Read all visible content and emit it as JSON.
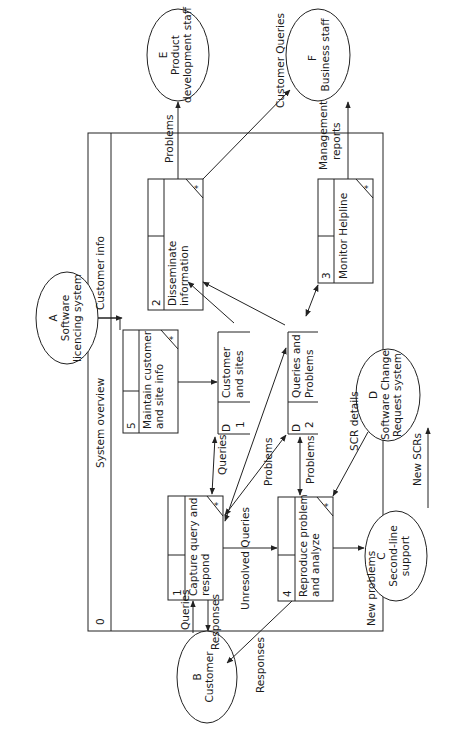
{
  "diagram": {
    "type": "data-flow-diagram",
    "orientation": "rotated-90-ccw",
    "system_boundary": {
      "id": "0",
      "title": "System overview"
    },
    "external_entities": [
      {
        "id": "A",
        "name": "Software licencing system",
        "line1": "Software",
        "line2": "licencing system"
      },
      {
        "id": "B",
        "name": "Customer",
        "line1": "Customer",
        "line2": ""
      },
      {
        "id": "C",
        "name": "Second-line support",
        "line1": "Second-line",
        "line2": "support"
      },
      {
        "id": "D",
        "name": "Software Change Request system",
        "line1": "Software Change",
        "line2": "Request system"
      },
      {
        "id": "E",
        "name": "Product development staff",
        "line1": "Product",
        "line2": "development staff"
      },
      {
        "id": "F",
        "name": "Business staff",
        "line1": "Business staff",
        "line2": ""
      }
    ],
    "processes": [
      {
        "id": "1",
        "line1": "Capture query and",
        "line2": "respond",
        "marker": "*"
      },
      {
        "id": "2",
        "line1": "Disseminate",
        "line2": "information",
        "marker": "*"
      },
      {
        "id": "3",
        "line1": "Monitor Helpline",
        "line2": "",
        "marker": "*"
      },
      {
        "id": "4",
        "line1": "Reproduce problem",
        "line2": "and analyze",
        "marker": "*"
      },
      {
        "id": "5",
        "line1": "Maintain customer",
        "line2": "and site info",
        "marker": "*"
      }
    ],
    "data_stores": [
      {
        "prefix": "D",
        "id": "1",
        "line1": "Customer",
        "line2": "and sites"
      },
      {
        "prefix": "D",
        "id": "2",
        "line1": "Queries and",
        "line2": "Problems"
      }
    ],
    "flows": {
      "customer_info": "Customer info",
      "problems_to_e": "Problems",
      "customer_queries": "Customer Queries",
      "management_reports_1": "Management",
      "management_reports_2": "reports",
      "queries_in": "Queries",
      "responses_out": "Responses",
      "queries_d1": "Queries",
      "problems_diag": "Problems",
      "problems_d2": "Problems",
      "unresolved_queries": "Unresolved Queries",
      "scr_details": "SCR details",
      "new_problems": "New problems",
      "new_scrs": "New SCRs",
      "responses_from_4": "Responses"
    }
  }
}
